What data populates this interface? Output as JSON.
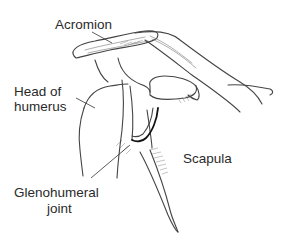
{
  "diagram": {
    "labels": {
      "acromion": "Acromion",
      "head_of_humerus_line1": "Head of",
      "head_of_humerus_line2": "humerus",
      "scapula": "Scapula",
      "glenohumeral_line1": "Glenohumeral",
      "glenohumeral_line2": "joint"
    },
    "colors": {
      "background": "#ffffff",
      "line": "#444444",
      "text": "#2a2a2a"
    }
  }
}
